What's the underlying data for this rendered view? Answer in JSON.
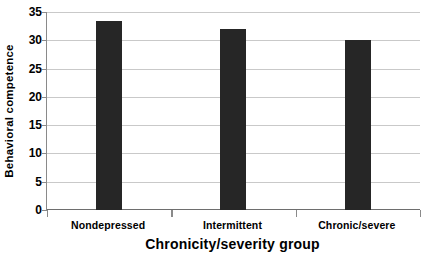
{
  "chart_data": {
    "type": "bar",
    "title": "",
    "xlabel": "Chronicity/severity group",
    "ylabel": "Behavioral competence",
    "categories": [
      "Nondepressed",
      "Intermittent",
      "Chronic/severe"
    ],
    "values": [
      33.5,
      32.0,
      30.0
    ],
    "ylim": [
      0,
      35
    ],
    "yticks": [
      0,
      5,
      10,
      15,
      20,
      25,
      30,
      35
    ],
    "ytick_labels": [
      "0",
      "5",
      "10",
      "15",
      "20",
      "25",
      "30",
      "35"
    ],
    "grid": "horizontal",
    "legend": "none",
    "bar_color": "#262626",
    "gridline_color": "#c9c9c9",
    "axis_color": "#6e6e6e",
    "background_color": "#ffffff"
  }
}
